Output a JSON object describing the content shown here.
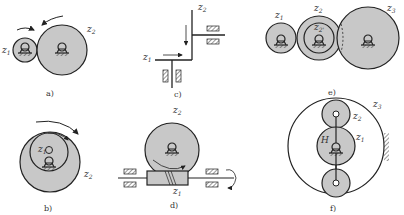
{
  "figure": {
    "colors": {
      "gear_fill": "#c8c8c8",
      "stroke": "#222222",
      "background": "#ffffff"
    },
    "panels": [
      {
        "id": "a",
        "caption": "a)",
        "labels": {
          "z1": "z",
          "z1_sub": "1",
          "z2": "z",
          "z2_sub": "2"
        },
        "description": "external spur gear pair"
      },
      {
        "id": "b",
        "caption": "b)",
        "labels": {
          "z1": "z",
          "z1_sub": "1",
          "z2": "z",
          "z2_sub": "2"
        },
        "description": "internal gear pair"
      },
      {
        "id": "c",
        "caption": "c)",
        "labels": {
          "z1": "z",
          "z1_sub": "1",
          "z2": "z",
          "z2_sub": "2"
        },
        "description": "bevel gear pair (schematic)"
      },
      {
        "id": "d",
        "caption": "d)",
        "labels": {
          "z1": "z",
          "z1_sub": "1",
          "z2": "z",
          "z2_sub": "2"
        },
        "description": "worm and worm wheel"
      },
      {
        "id": "e",
        "caption": "e)",
        "labels": {
          "z1": "z",
          "z1_sub": "1",
          "z2": "z",
          "z2_sub": "2",
          "z2p": "z",
          "z2p_sub": "2'",
          "z3": "z",
          "z3_sub": "3"
        },
        "description": "compound gear train"
      },
      {
        "id": "f",
        "caption": "f)",
        "labels": {
          "z1": "z",
          "z1_sub": "1",
          "z2": "z",
          "z2_sub": "2",
          "z3": "z",
          "z3_sub": "3",
          "H": "H"
        },
        "description": "planetary gear train"
      }
    ]
  }
}
